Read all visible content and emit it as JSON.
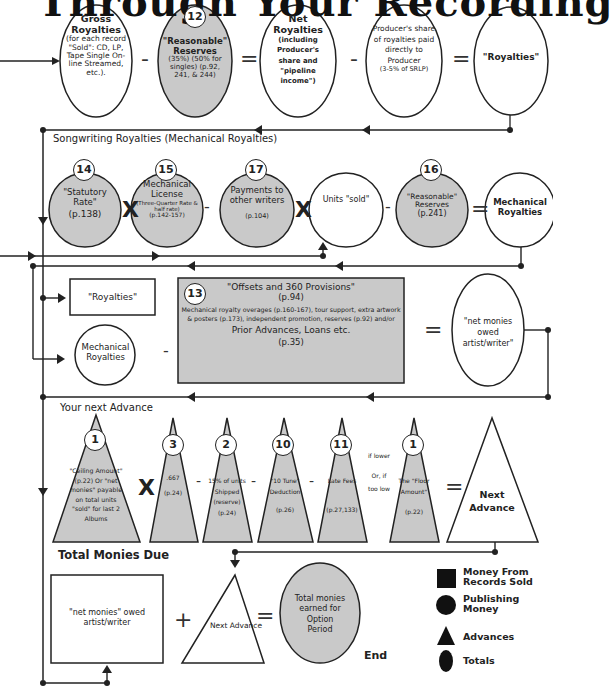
{
  "title": "Through Your Recording",
  "colors": {
    "shaded": "#c9c9c9",
    "line": "#222222",
    "white": "#ffffff"
  },
  "row1": {
    "gross": {
      "title": "Gross Royalties",
      "body": "(for each record \"Sold\": CD, LP, Tape Single On-line Streamed, etc.)."
    },
    "reserves": {
      "badge": "12",
      "title": "\"Reasonable\" Reserves",
      "body": "(35%) (50% for singles) (p.92, 241, & 244)"
    },
    "net": {
      "title": "Net Royalties",
      "body": "(including Producer's share and \"pipeline income\")"
    },
    "producer": {
      "body": "Producer's share of royalties paid directly to Producer",
      "note": "(3-5% of SRLP)"
    },
    "royalties": {
      "title": "\"Royalties\""
    },
    "ops": [
      "-",
      "=",
      "-",
      "="
    ]
  },
  "row2": {
    "section_label": "Songwriting Royalties (Mechanical Royalties)",
    "statutory": {
      "badge": "14",
      "title": "\"Statutory Rate\"",
      "ref": "(p.138)"
    },
    "license": {
      "badge": "15",
      "title": "Mechanical License",
      "body": "(Three-Quarter Rate & half rate)",
      "ref": "(p.142-157)"
    },
    "payments": {
      "badge": "17",
      "title": "Payments to other writers",
      "ref": "(p.104)"
    },
    "units": {
      "title": "Units \"sold\""
    },
    "reserves": {
      "badge": "16",
      "title": "\"Reasonable\" Reserves",
      "ref": "(p.241)"
    },
    "mech": {
      "title": "Mechanical Royalties"
    },
    "ops": [
      "X",
      "-",
      "X",
      "-",
      "="
    ]
  },
  "row3": {
    "royalties_box": "\"Royalties\"",
    "mech_circle": "Mechanical Royalties",
    "offsets": {
      "badge": "13",
      "title": "\"Offsets and 360 Provisions\"",
      "ref": "(p.94)",
      "body": "Mechanical royalty overages (p.160-167), tour support, extra artwork & posters (p.173), independent promotion, reserves (p.92) and/or",
      "prior": "Prior Advances, Loans etc.",
      "prior_ref": "(p.35)"
    },
    "net_monies": "\"net monies owed artist/writer\"",
    "ops": [
      "-",
      "="
    ]
  },
  "row4": {
    "section_label": "Your next Advance",
    "ceiling": {
      "badge": "1",
      "body": "\"Ceiling Amount\" (p.22) Or \"net monies\" payable on total units \"sold\" for last 2 Albums"
    },
    "rate": {
      "badge": "3",
      "body": ".667",
      "ref": "(p.24)"
    },
    "shipped": {
      "badge": "2",
      "body": "15% of units Shipped (reserve)",
      "ref": "(p.24)"
    },
    "tune": {
      "badge": "10",
      "body": "\"10 Tune\" Deduction",
      "ref": "(p.26)"
    },
    "late": {
      "badge": "11",
      "body": "Late Fees",
      "ref": "(p.27,133)"
    },
    "condition": {
      "top": "if lower",
      "bottom": "Or, if too low"
    },
    "floor": {
      "badge": "1",
      "body": "The \"Floor Amount\"",
      "ref": "(p.22)"
    },
    "next": "Next Advance",
    "ops": [
      "X",
      "-",
      "-",
      "-",
      "="
    ]
  },
  "row5": {
    "section_label": "Total Monies Due",
    "net_box": "\"net monies\" owed artist/writer",
    "next": "Next Advance",
    "total": "Total monies earned for Option Period",
    "end": "End",
    "ops": [
      "+",
      "="
    ]
  },
  "legend": [
    {
      "shape": "square-icon",
      "label": "Money From Records Sold"
    },
    {
      "shape": "circle-icon",
      "label": "Publishing Money"
    },
    {
      "shape": "triangle-icon",
      "label": "Advances"
    },
    {
      "shape": "oval-icon",
      "label": "Totals"
    }
  ]
}
